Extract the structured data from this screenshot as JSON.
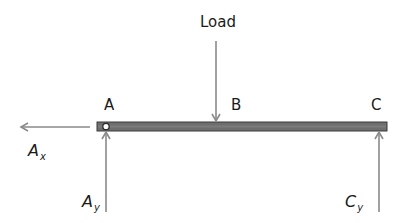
{
  "diagram": {
    "type": "free-body-diagram",
    "load": {
      "label": "Load"
    },
    "points": [
      {
        "id": "A",
        "label": "A"
      },
      {
        "id": "B",
        "label": "B"
      },
      {
        "id": "C",
        "label": "C"
      }
    ],
    "forces": [
      {
        "id": "Ax",
        "symbol": "A",
        "subscript": "x",
        "direction": "left"
      },
      {
        "id": "Ay",
        "symbol": "A",
        "subscript": "y",
        "direction": "up"
      },
      {
        "id": "Cy",
        "symbol": "C",
        "subscript": "y",
        "direction": "up"
      }
    ],
    "colors": {
      "arrow": "#8a8a8a",
      "beam": "#6e6e6e",
      "beam_border": "#3a3a3a",
      "text": "#1a1a1a"
    }
  }
}
